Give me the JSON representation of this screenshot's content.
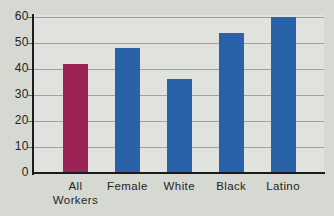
{
  "chart_data": {
    "type": "bar",
    "title": "",
    "xlabel": "",
    "ylabel": "",
    "categories": [
      "All Workers",
      "Female",
      "White",
      "Black",
      "Latino"
    ],
    "category_label_lines": [
      [
        "All",
        "Workers"
      ],
      [
        "Female"
      ],
      [
        "White"
      ],
      [
        "Black"
      ],
      [
        "Latino"
      ]
    ],
    "values": [
      42,
      48,
      36,
      54,
      60
    ],
    "bar_colors": [
      "#9c2355",
      "#2a62aa",
      "#2a62aa",
      "#2a62aa",
      "#2a62aa"
    ],
    "ylim": [
      0,
      60
    ],
    "yticks": [
      0,
      10,
      20,
      30,
      40,
      50,
      60
    ],
    "grid": "horizontal",
    "legend": "none"
  },
  "colors": {
    "background": "#d6d8d2",
    "plot_background": "#e0e2de",
    "gridline": "#a0a29e",
    "axis": "#1b1b1b",
    "highlight_bar": "#9c2355",
    "default_bar": "#2a62aa",
    "text": "#242424"
  }
}
